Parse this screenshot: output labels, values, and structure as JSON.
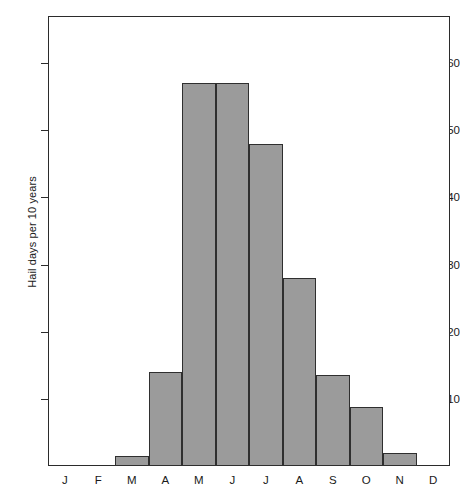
{
  "chart_data": {
    "type": "bar",
    "title": "",
    "subtitle": "",
    "xlabel": "",
    "ylabel": "Hail days per 10 years",
    "categories": [
      "J",
      "F",
      "M",
      "A",
      "M",
      "J",
      "J",
      "A",
      "S",
      "O",
      "N",
      "D"
    ],
    "category_names": [
      "January",
      "February",
      "March",
      "April",
      "May",
      "June",
      "July",
      "August",
      "September",
      "October",
      "November",
      "December"
    ],
    "values": [
      0,
      0,
      1.5,
      14,
      57,
      57,
      48,
      28,
      13.5,
      8.8,
      2,
      0
    ],
    "ylim": [
      0,
      67
    ],
    "xlim": [
      0,
      12
    ],
    "yticks": [
      10,
      20,
      30,
      40,
      50,
      60
    ],
    "ytick_labels": [
      "10",
      "20",
      "30",
      "40",
      "50",
      "60"
    ],
    "grid": false,
    "legend": false,
    "bar_style": "contiguous-histogram",
    "bar_fill_color": "#9b9b9b",
    "bar_edge_color": "#2f2f2f",
    "frame_color": "#2b2b2b",
    "background_color": "#ffffff"
  }
}
